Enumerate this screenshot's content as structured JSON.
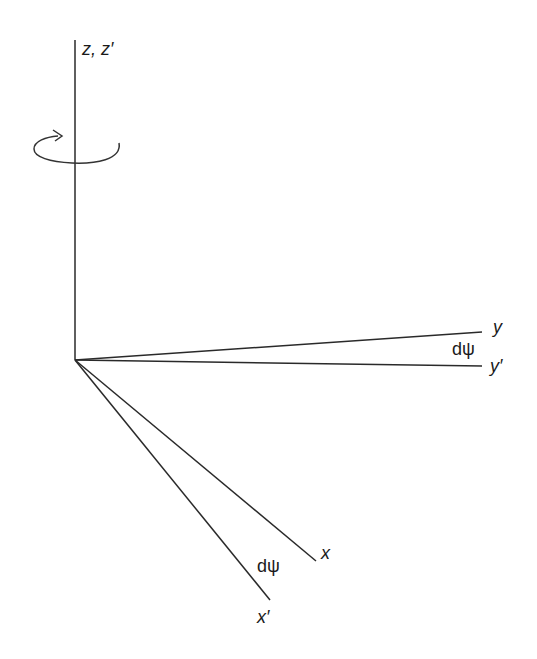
{
  "diagram": {
    "origin": [
      75,
      360
    ],
    "colors": {
      "line": "#2a2a2a",
      "background": "#ffffff"
    },
    "axes": {
      "z": {
        "label": "z, z′",
        "end": [
          75,
          40
        ]
      },
      "y": {
        "label": "y",
        "end": [
          482,
          332
        ]
      },
      "y_prime": {
        "label": "y′",
        "end": [
          482,
          366
        ]
      },
      "x": {
        "label": "x",
        "end": [
          316,
          561
        ]
      },
      "x_prime": {
        "label": "x′",
        "end": [
          270,
          600
        ]
      }
    },
    "angle_labels": {
      "y_pair": "dψ",
      "x_pair": "dψ"
    },
    "rotation_indicator": "rotation-arrow about z axis"
  }
}
